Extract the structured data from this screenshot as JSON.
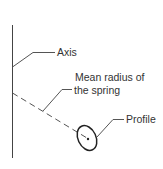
{
  "diagram": {
    "labels": {
      "axis": "Axis",
      "mean_radius_line1": "Mean radius of",
      "mean_radius_line2": "the spring",
      "profile": "Profile"
    },
    "colors": {
      "line": "#444444",
      "text": "#333333",
      "background": "#ffffff"
    }
  }
}
